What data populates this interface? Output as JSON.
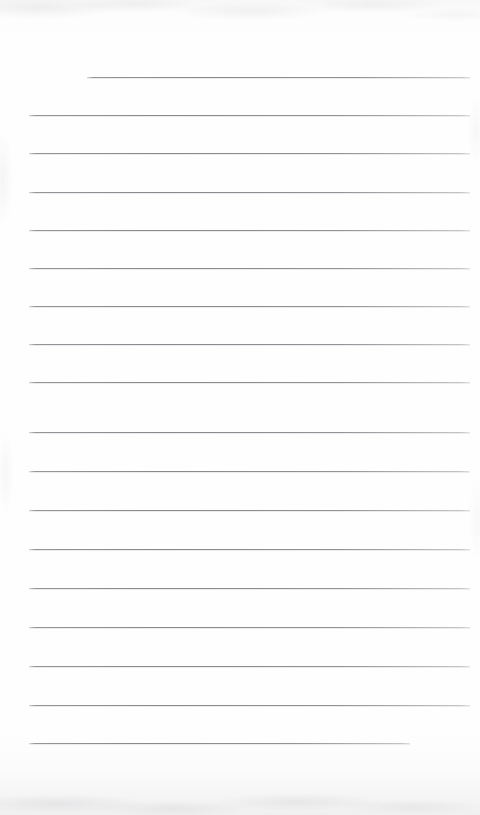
{
  "document": {
    "kind": "scanned-lined-paper",
    "title": "Blank lined notebook page",
    "orientation": "portrait",
    "width_px": 480,
    "height_px": 815,
    "page_content_text": "",
    "has_handwriting": false,
    "has_printed_text": false,
    "line_count": 18,
    "colors": {
      "paper": "#fefefe",
      "paper_edge": "#f0f0f1",
      "rule": "#8c8c91",
      "rule_soft": "#9a9a9e"
    },
    "ruling": {
      "first_line_y": 77,
      "line_spacing": 38.2,
      "left_margin_x": 29,
      "right_margin_x": 470,
      "first_line_indent_x": 87,
      "last_line_end_x": 410
    },
    "lines": [
      {
        "index": 1,
        "y": 77,
        "x1": 87,
        "x2": 470,
        "note": "indented-first-line"
      },
      {
        "index": 2,
        "y": 115,
        "x1": 29,
        "x2": 470,
        "note": ""
      },
      {
        "index": 3,
        "y": 153,
        "x1": 29,
        "x2": 470,
        "note": ""
      },
      {
        "index": 4,
        "y": 192,
        "x1": 29,
        "x2": 470,
        "note": ""
      },
      {
        "index": 5,
        "y": 230,
        "x1": 29,
        "x2": 470,
        "note": ""
      },
      {
        "index": 6,
        "y": 268,
        "x1": 29,
        "x2": 470,
        "note": ""
      },
      {
        "index": 7,
        "y": 306,
        "x1": 29,
        "x2": 470,
        "note": ""
      },
      {
        "index": 8,
        "y": 344,
        "x1": 29,
        "x2": 470,
        "note": ""
      },
      {
        "index": 9,
        "y": 382,
        "x1": 29,
        "x2": 470,
        "note": ""
      },
      {
        "index": 10,
        "y": 432,
        "x1": 29,
        "x2": 470,
        "note": ""
      },
      {
        "index": 11,
        "y": 471,
        "x1": 29,
        "x2": 470,
        "note": ""
      },
      {
        "index": 12,
        "y": 510,
        "x1": 29,
        "x2": 470,
        "note": ""
      },
      {
        "index": 13,
        "y": 549,
        "x1": 29,
        "x2": 470,
        "note": ""
      },
      {
        "index": 14,
        "y": 588,
        "x1": 29,
        "x2": 470,
        "note": ""
      },
      {
        "index": 15,
        "y": 627,
        "x1": 29,
        "x2": 470,
        "note": ""
      },
      {
        "index": 16,
        "y": 666,
        "x1": 29,
        "x2": 470,
        "note": ""
      },
      {
        "index": 17,
        "y": 705,
        "x1": 29,
        "x2": 470,
        "note": ""
      },
      {
        "index": 18,
        "y": 743,
        "x1": 29,
        "x2": 410,
        "note": "short-final-line"
      }
    ]
  }
}
